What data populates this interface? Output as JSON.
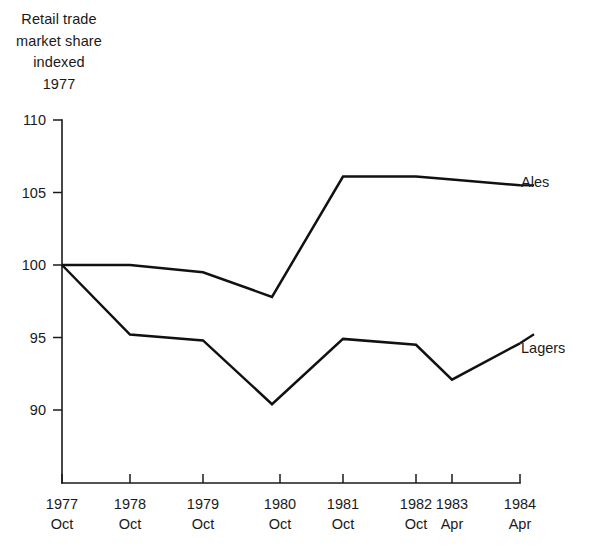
{
  "chart_data": {
    "type": "line",
    "title": "Retail trade market share indexed 1977",
    "title_lines": [
      "Retail trade",
      "market share",
      "indexed",
      "1977"
    ],
    "xlabel": "",
    "ylabel": "",
    "ylim": [
      86,
      110
    ],
    "yticks": [
      110,
      105,
      100,
      95,
      90
    ],
    "ytick_labels": [
      "110",
      "105",
      "100",
      "95",
      "90"
    ],
    "grid": false,
    "legend_position": "right-of-line-end",
    "categories": [
      "1977 Oct",
      "1978 Oct",
      "1979 Oct",
      "1980 Oct",
      "1981 Oct",
      "1982 Oct",
      "1983 Apr",
      "1984 Apr"
    ],
    "xtick_years": [
      "1977",
      "1978",
      "1979",
      "1980",
      "1981",
      "1982",
      "1983",
      "1984"
    ],
    "xtick_months": [
      "Oct",
      "Oct",
      "Oct",
      "Oct",
      "Oct",
      "Oct",
      "Apr",
      "Apr"
    ],
    "series": [
      {
        "name": "Ales",
        "values": [
          100.0,
          100.0,
          99.5,
          97.8,
          106.1,
          106.1,
          105.9,
          105.5
        ],
        "color": "#111111"
      },
      {
        "name": "Lagers",
        "values": [
          100.0,
          95.2,
          94.8,
          90.4,
          94.9,
          94.5,
          92.1,
          94.6
        ],
        "color": "#111111"
      }
    ]
  },
  "labels": {
    "ales": "Ales",
    "lagers": "Lagers"
  }
}
